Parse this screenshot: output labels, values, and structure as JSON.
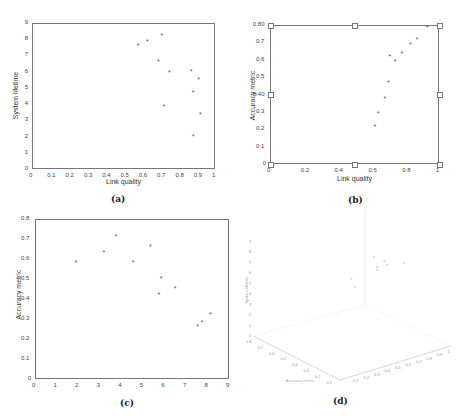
{
  "chart_data": [
    {
      "id": "a",
      "type": "scatter",
      "caption": "(a)",
      "title": "",
      "xlabel": "Link quality",
      "ylabel": "System lifetime",
      "xlim": [
        0,
        1
      ],
      "ylim": [
        0,
        9
      ],
      "xticks": [
        "0",
        "0.1",
        "0.2",
        "0.3",
        "0.4",
        "0.5",
        "0.6",
        "0.7",
        "0.8",
        "0.9",
        "1"
      ],
      "yticks": [
        "0",
        "1",
        "2",
        "3",
        "4",
        "5",
        "6",
        "7",
        "8",
        "9"
      ],
      "grid": false,
      "marker": "*",
      "points": [
        {
          "x": 0.58,
          "y": 7.6
        },
        {
          "x": 0.63,
          "y": 7.8
        },
        {
          "x": 0.71,
          "y": 8.2
        },
        {
          "x": 0.69,
          "y": 6.6
        },
        {
          "x": 0.75,
          "y": 5.9
        },
        {
          "x": 0.72,
          "y": 3.8
        },
        {
          "x": 0.87,
          "y": 6.0
        },
        {
          "x": 0.91,
          "y": 5.5
        },
        {
          "x": 0.88,
          "y": 4.7
        },
        {
          "x": 0.92,
          "y": 3.3
        },
        {
          "x": 0.88,
          "y": 1.95
        }
      ]
    },
    {
      "id": "b",
      "type": "scatter",
      "caption": "(b)",
      "title": "",
      "xlabel": "Link quality",
      "ylabel": "Accuracy metric",
      "xlim": [
        0,
        1
      ],
      "ylim": [
        0,
        0.8
      ],
      "xticks": [
        "0",
        "0.2",
        "0.4",
        "0.6",
        "0.8",
        "1"
      ],
      "yticks": [
        "0",
        "0.1",
        "0.2",
        "0.3",
        "0.40",
        "0.5",
        "0.6",
        "0.7",
        "0.80"
      ],
      "grid": false,
      "marker": "*",
      "points": [
        {
          "x": 0.62,
          "y": 0.215
        },
        {
          "x": 0.64,
          "y": 0.285
        },
        {
          "x": 0.68,
          "y": 0.375
        },
        {
          "x": 0.7,
          "y": 0.465
        },
        {
          "x": 0.71,
          "y": 0.615
        },
        {
          "x": 0.74,
          "y": 0.585
        },
        {
          "x": 0.78,
          "y": 0.635
        },
        {
          "x": 0.83,
          "y": 0.685
        },
        {
          "x": 0.87,
          "y": 0.715
        },
        {
          "x": 0.93,
          "y": 0.785
        }
      ],
      "square_markers": [
        {
          "x": 0,
          "y": 0
        },
        {
          "x": 0.5,
          "y": 0
        },
        {
          "x": 1,
          "y": 0
        },
        {
          "x": 0,
          "y": 0.4
        },
        {
          "x": 1,
          "y": 0.4
        },
        {
          "x": 0,
          "y": 0.8
        },
        {
          "x": 0.5,
          "y": 0.8
        },
        {
          "x": 1,
          "y": 0.8
        }
      ]
    },
    {
      "id": "c",
      "type": "scatter",
      "caption": "(c)",
      "title": "",
      "xlabel": "",
      "ylabel": "Accuracy metric",
      "xlim": [
        0,
        9
      ],
      "ylim": [
        0,
        0.8
      ],
      "xticks": [
        "0",
        "1",
        "2",
        "3",
        "4",
        "5",
        "6",
        "7",
        "8",
        "9"
      ],
      "yticks": [
        "0",
        "0.1",
        "0.2",
        "0.3",
        "0.4",
        "0.5",
        "0.6",
        "0.7",
        "0.8"
      ],
      "grid": false,
      "marker": "*",
      "points": [
        {
          "x": 1.9,
          "y": 0.58
        },
        {
          "x": 3.2,
          "y": 0.63
        },
        {
          "x": 3.75,
          "y": 0.71
        },
        {
          "x": 4.55,
          "y": 0.58
        },
        {
          "x": 5.35,
          "y": 0.66
        },
        {
          "x": 5.85,
          "y": 0.5
        },
        {
          "x": 5.75,
          "y": 0.42
        },
        {
          "x": 6.5,
          "y": 0.45
        },
        {
          "x": 7.55,
          "y": 0.26
        },
        {
          "x": 7.75,
          "y": 0.28
        },
        {
          "x": 8.15,
          "y": 0.32
        }
      ]
    },
    {
      "id": "d",
      "type": "scatter3d",
      "caption": "(d)",
      "title": "",
      "zlabel": "System lifetime",
      "xlabel": "Accuracy metric",
      "ylabel": "Link quality",
      "zticks": [
        "0",
        "1",
        "2",
        "3",
        "4",
        "5",
        "6",
        "7",
        "8",
        "9"
      ],
      "left_axis_ticks": [
        "0.8",
        "0.7",
        "0.6",
        "0.5",
        "0.4",
        "0.3",
        "0.2",
        "0.1"
      ],
      "right_axis_ticks": [
        "0.1",
        "0.2",
        "0.3",
        "0.4",
        "0.5",
        "0.6",
        "0.7",
        "0.8",
        "0.9",
        "1"
      ],
      "grid": false,
      "marker": "*"
    }
  ]
}
